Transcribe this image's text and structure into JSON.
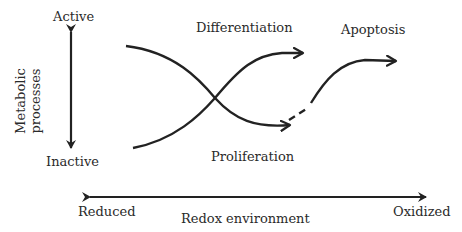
{
  "diagram": {
    "y_axis": {
      "title_line1": "Metabolic",
      "title_line2": "processes",
      "top_label": "Active",
      "bottom_label": "Inactive"
    },
    "x_axis": {
      "title": "Redox environment",
      "left_label": "Reduced",
      "right_label": "Oxidized"
    },
    "curves": {
      "differentiation": "Differentiation",
      "proliferation": "Proliferation",
      "apoptosis": "Apoptosis"
    },
    "colors": {
      "stroke": "#222222",
      "text": "#2a2a2a",
      "background": "#ffffff"
    }
  }
}
